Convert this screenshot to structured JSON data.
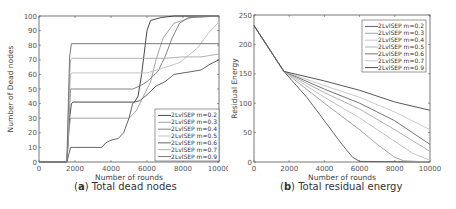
{
  "chart_data": [
    {
      "type": "line",
      "id": "a",
      "title": "Total dead nodes",
      "caption_letter": "a",
      "xlabel": "Number of rounds",
      "ylabel": "Number of Dead nodes",
      "xlim": [
        0,
        10000
      ],
      "ylim": [
        0,
        100
      ],
      "xticks": [
        0,
        2000,
        4000,
        6000,
        8000,
        10000
      ],
      "yticks": [
        0,
        10,
        20,
        30,
        40,
        50,
        60,
        70,
        80,
        90,
        100
      ],
      "grid": false,
      "legend_position": "lower right",
      "series": [
        {
          "name": "2LvlSEP m=0.2",
          "color": "#333333",
          "points": [
            [
              0,
              0
            ],
            [
              1550,
              0
            ],
            [
              1600,
              10
            ],
            [
              1700,
              30
            ],
            [
              1800,
              40
            ],
            [
              1900,
              41
            ],
            [
              5300,
              41
            ],
            [
              5500,
              45
            ],
            [
              5700,
              60
            ],
            [
              5900,
              80
            ],
            [
              6000,
              90
            ],
            [
              6200,
              97
            ],
            [
              6800,
              99
            ],
            [
              7500,
              100
            ],
            [
              10000,
              100
            ]
          ]
        },
        {
          "name": "2LvlSEP m=0.3",
          "color": "#9a9a9a",
          "points": [
            [
              0,
              0
            ],
            [
              1550,
              0
            ],
            [
              1650,
              20
            ],
            [
              1750,
              30
            ],
            [
              1850,
              30
            ],
            [
              5000,
              30
            ],
            [
              5400,
              35
            ],
            [
              5800,
              45
            ],
            [
              6200,
              55
            ],
            [
              6500,
              70
            ],
            [
              6900,
              85
            ],
            [
              7500,
              95
            ],
            [
              8500,
              99
            ],
            [
              10000,
              100
            ]
          ]
        },
        {
          "name": "2LvlSEP m=0.4",
          "color": "#777777",
          "points": [
            [
              0,
              0
            ],
            [
              1550,
              0
            ],
            [
              1650,
              25
            ],
            [
              1750,
              50
            ],
            [
              1850,
              50
            ],
            [
              5200,
              50
            ],
            [
              5600,
              52
            ],
            [
              6000,
              55
            ],
            [
              6600,
              62
            ],
            [
              7000,
              72
            ],
            [
              7400,
              85
            ],
            [
              7800,
              95
            ],
            [
              8300,
              99
            ],
            [
              10000,
              100
            ]
          ]
        },
        {
          "name": "2LvlSEP m=0.5",
          "color": "#bdbdbd",
          "points": [
            [
              0,
              0
            ],
            [
              1550,
              0
            ],
            [
              1650,
              30
            ],
            [
              1750,
              60
            ],
            [
              1850,
              61
            ],
            [
              6000,
              61
            ],
            [
              6800,
              64
            ],
            [
              7800,
              68
            ],
            [
              8800,
              78
            ],
            [
              9400,
              88
            ],
            [
              10000,
              96
            ]
          ]
        },
        {
          "name": "2LvlSEP m=0.6",
          "color": "#555555",
          "points": [
            [
              0,
              0
            ],
            [
              1550,
              0
            ],
            [
              1650,
              5
            ],
            [
              1750,
              10
            ],
            [
              1900,
              10
            ],
            [
              3500,
              10
            ],
            [
              3700,
              13
            ],
            [
              4000,
              15
            ],
            [
              4400,
              16
            ],
            [
              4700,
              20
            ],
            [
              5000,
              30
            ],
            [
              5200,
              40
            ],
            [
              5300,
              41
            ],
            [
              5600,
              42
            ],
            [
              6000,
              46
            ],
            [
              6500,
              52
            ],
            [
              7000,
              55
            ],
            [
              7500,
              60
            ],
            [
              8500,
              62
            ],
            [
              9000,
              63
            ],
            [
              9500,
              67
            ],
            [
              10000,
              70
            ]
          ]
        },
        {
          "name": "2LvlSEP m=0.7",
          "color": "#a8a8a8",
          "points": [
            [
              0,
              0
            ],
            [
              1550,
              0
            ],
            [
              1650,
              40
            ],
            [
              1750,
              70
            ],
            [
              1850,
              71
            ],
            [
              7000,
              71
            ],
            [
              8000,
              72
            ],
            [
              9000,
              72
            ],
            [
              10000,
              74
            ]
          ]
        },
        {
          "name": "2LvlSEP m=0.9",
          "color": "#6a6a6a",
          "points": [
            [
              0,
              0
            ],
            [
              1550,
              0
            ],
            [
              1650,
              50
            ],
            [
              1700,
              72
            ],
            [
              1800,
              81
            ],
            [
              10000,
              81
            ]
          ]
        }
      ]
    },
    {
      "type": "line",
      "id": "b",
      "title": "Total residual energy",
      "caption_letter": "b",
      "xlabel": "Number of rounds",
      "ylabel": "Residual Energy",
      "xlim": [
        0,
        10000
      ],
      "ylim": [
        0,
        250
      ],
      "xticks": [
        0,
        2000,
        4000,
        6000,
        8000,
        10000
      ],
      "yticks": [
        0,
        50,
        100,
        150,
        200,
        250
      ],
      "grid": false,
      "legend_position": "upper right",
      "series": [
        {
          "name": "2LvlSEP m=0.2",
          "color": "#555555",
          "points": [
            [
              0,
              232
            ],
            [
              1700,
              154
            ],
            [
              3000,
              110
            ],
            [
              4000,
              70
            ],
            [
              5000,
              30
            ],
            [
              5600,
              8
            ],
            [
              6000,
              1
            ],
            [
              10000,
              0
            ]
          ]
        },
        {
          "name": "2LvlSEP m=0.3",
          "color": "#9a9a9a",
          "points": [
            [
              0,
              232
            ],
            [
              1700,
              154
            ],
            [
              4000,
              100
            ],
            [
              6000,
              55
            ],
            [
              7000,
              30
            ],
            [
              8000,
              8
            ],
            [
              8500,
              2
            ],
            [
              10000,
              0
            ]
          ]
        },
        {
          "name": "2LvlSEP m=0.4",
          "color": "#bdbdbd",
          "points": [
            [
              0,
              232
            ],
            [
              1700,
              154
            ],
            [
              4000,
              110
            ],
            [
              6000,
              75
            ],
            [
              8000,
              35
            ],
            [
              9000,
              15
            ],
            [
              10000,
              3
            ]
          ]
        },
        {
          "name": "2LvlSEP m=0.5",
          "color": "#a8a8a8",
          "points": [
            [
              0,
              232
            ],
            [
              1700,
              154
            ],
            [
              4000,
              118
            ],
            [
              6000,
              90
            ],
            [
              8000,
              55
            ],
            [
              10000,
              18
            ]
          ]
        },
        {
          "name": "2LvlSEP m=0.6",
          "color": "#666666",
          "points": [
            [
              0,
              232
            ],
            [
              1700,
              154
            ],
            [
              4000,
              124
            ],
            [
              6000,
              100
            ],
            [
              8000,
              70
            ],
            [
              10000,
              30
            ]
          ]
        },
        {
          "name": "2LvlSEP m=0.7",
          "color": "#c4c4c4",
          "points": [
            [
              0,
              232
            ],
            [
              1700,
              154
            ],
            [
              4000,
              130
            ],
            [
              6000,
              110
            ],
            [
              8000,
              85
            ],
            [
              10000,
              55
            ]
          ]
        },
        {
          "name": "2LvlSEP m=0.9",
          "color": "#444444",
          "points": [
            [
              0,
              232
            ],
            [
              1700,
              154
            ],
            [
              4000,
              138
            ],
            [
              6000,
              122
            ],
            [
              8000,
              102
            ],
            [
              10000,
              88
            ]
          ]
        }
      ]
    }
  ],
  "captions": {
    "a": {
      "letter": "a",
      "text": " Total dead nodes"
    },
    "b": {
      "letter": "b",
      "text": " Total residual energy"
    }
  }
}
